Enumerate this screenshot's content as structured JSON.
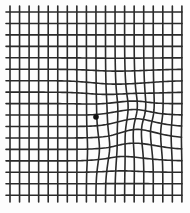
{
  "figure": {
    "type": "amsler-grid",
    "colors": {
      "background": "#fdfdfd",
      "line": "#2a2a2a",
      "dot": "#111111"
    },
    "line_width": 1.6,
    "vertical_lines": {
      "count": 19,
      "x_start": 10,
      "spacing": 9.55,
      "y_top": 6,
      "y_bottom": 203
    },
    "horizontal_lines": {
      "count": 17,
      "y_start": 12,
      "spacing": 11.45,
      "x_left": 6,
      "x_right": 183
    },
    "fixation_dot": {
      "x": 96,
      "y": 117,
      "r": 2.8
    },
    "distortions": [
      {
        "cx": 128,
        "cy": 118,
        "rx": 28,
        "ry": 40,
        "dx": 4,
        "dy": -5
      },
      {
        "cx": 122,
        "cy": 85,
        "rx": 40,
        "ry": 22,
        "dx": 0,
        "dy": 5
      },
      {
        "cx": 145,
        "cy": 138,
        "rx": 30,
        "ry": 22,
        "dx": -4,
        "dy": -6
      },
      {
        "cx": 118,
        "cy": 160,
        "rx": 26,
        "ry": 14,
        "dx": 0,
        "dy": -3
      },
      {
        "cx": 102,
        "cy": 150,
        "rx": 16,
        "ry": 24,
        "dx": 4,
        "dy": 0
      }
    ]
  }
}
